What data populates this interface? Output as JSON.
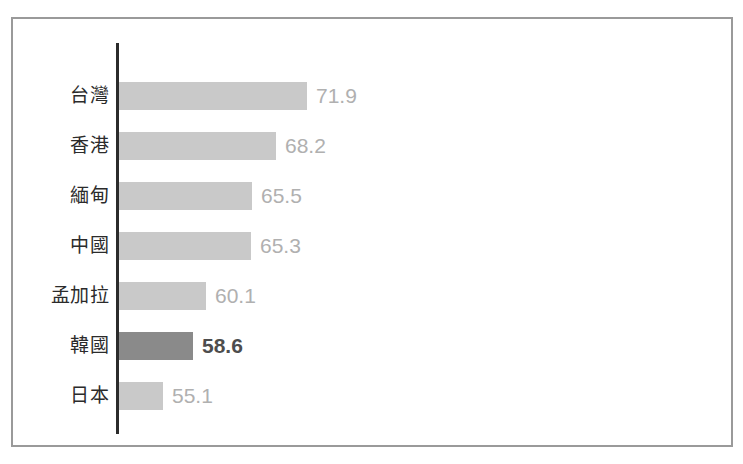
{
  "chart_data": {
    "type": "bar",
    "orientation": "horizontal",
    "title": "",
    "subtitle": "",
    "xlabel": "",
    "ylabel": "",
    "grid": false,
    "legend": null,
    "axis": {
      "category_axis": "y",
      "value_axis": "x",
      "value_axis_visible": false,
      "tick_labels_visible": false,
      "baseline_value": 50.0,
      "xlim": [
        50.0,
        74.0
      ]
    },
    "colors": {
      "bar_default": "#c9c9c9",
      "bar_highlight": "#8a8a8a",
      "value_label_default": "#b0b0b0",
      "value_label_highlight": "#4d4d4d",
      "category_label": "#2b2b2b",
      "axis_line": "#2b2b2b",
      "frame_border": "#9a9a9a",
      "background": "#ffffff"
    },
    "categories": [
      "台灣",
      "香港",
      "緬甸",
      "中國",
      "孟加拉",
      "韓國",
      "日本"
    ],
    "values": [
      71.9,
      68.2,
      65.5,
      65.3,
      60.1,
      58.6,
      55.1
    ],
    "value_labels": [
      "71.9",
      "68.2",
      "65.5",
      "65.3",
      "60.1",
      "58.6",
      "55.1"
    ],
    "highlight_index": 5,
    "bars": [
      {
        "category": "台灣",
        "value": 71.9,
        "label": "71.9",
        "highlighted": false
      },
      {
        "category": "香港",
        "value": 68.2,
        "label": "68.2",
        "highlighted": false
      },
      {
        "category": "緬甸",
        "value": 65.5,
        "label": "65.5",
        "highlighted": false
      },
      {
        "category": "中國",
        "value": 65.3,
        "label": "65.3",
        "highlighted": false
      },
      {
        "category": "孟加拉",
        "value": 60.1,
        "label": "60.1",
        "highlighted": false
      },
      {
        "category": "韓國",
        "value": 58.6,
        "label": "58.6",
        "highlighted": true
      },
      {
        "category": "日本",
        "value": 55.1,
        "label": "55.1",
        "highlighted": false
      }
    ]
  }
}
